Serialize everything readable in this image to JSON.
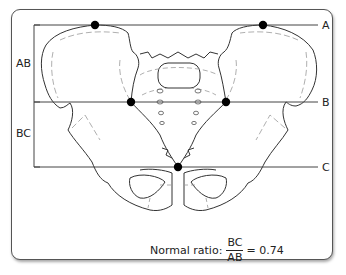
{
  "figure": {
    "lines": [
      {
        "id": "A",
        "label": "A",
        "y": 25
      },
      {
        "id": "B",
        "label": "B",
        "y": 102
      },
      {
        "id": "C",
        "label": "C",
        "y": 167
      }
    ],
    "brackets": [
      {
        "id": "AB",
        "label": "AB"
      },
      {
        "id": "BC",
        "label": "BC"
      }
    ],
    "points": [
      {
        "name": "iliac-crest-left",
        "x": 95,
        "y": 25
      },
      {
        "name": "iliac-crest-right",
        "x": 263,
        "y": 25
      },
      {
        "name": "sacroiliac-left",
        "x": 131,
        "y": 102
      },
      {
        "name": "sacroiliac-right",
        "x": 226,
        "y": 102
      },
      {
        "name": "coccyx-tip",
        "x": 178,
        "y": 167
      }
    ],
    "colors": {
      "line": "#444444",
      "point": "#000000",
      "bone_outline": "#333333",
      "bone_detail": "#9a9a9a",
      "frame": "#555555"
    }
  },
  "caption": {
    "prefix": "Normal ratio:",
    "numerator": "BC",
    "denominator": "AB",
    "equals": "= 0.74",
    "value": "0.74"
  }
}
